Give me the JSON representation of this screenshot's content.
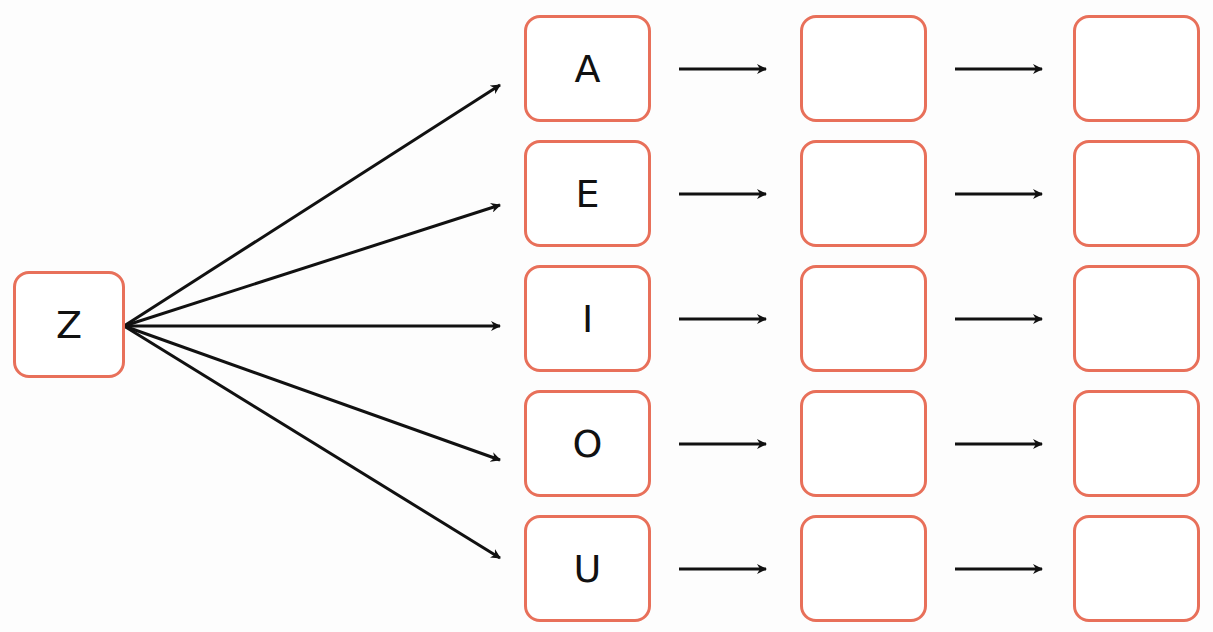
{
  "diagram": {
    "root": {
      "label": "Z"
    },
    "rows": [
      {
        "letter": "A",
        "step1": "",
        "step2": ""
      },
      {
        "letter": "E",
        "step1": "",
        "step2": ""
      },
      {
        "letter": "I",
        "step1": "",
        "step2": ""
      },
      {
        "letter": "O",
        "step1": "",
        "step2": ""
      },
      {
        "letter": "U",
        "step1": "",
        "step2": ""
      }
    ],
    "colors": {
      "box_border": "#e8705a",
      "arrow": "#111111",
      "background": "#fdfdfd"
    }
  }
}
